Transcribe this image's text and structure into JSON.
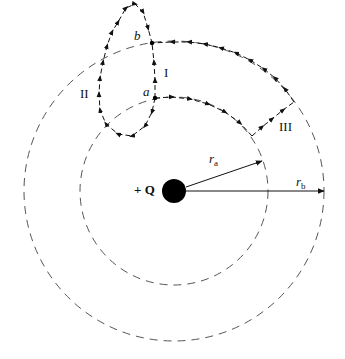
{
  "diagram": {
    "charge_label": "+ Q",
    "point_a": "a",
    "point_b": "b",
    "path_I": "I",
    "path_II": "II",
    "path_III": "III",
    "radius_a": {
      "main": "r",
      "sub": "a"
    },
    "radius_b": {
      "main": "r",
      "sub": "b"
    },
    "colors": {
      "line": "#111111",
      "dash": "#555555",
      "background": "#ffffff"
    }
  }
}
